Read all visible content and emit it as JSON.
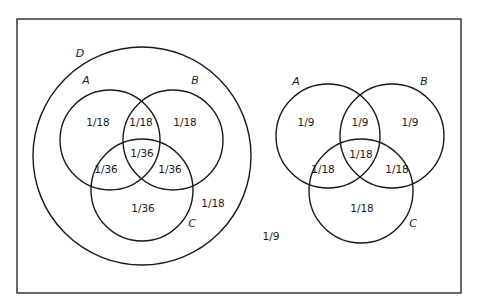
{
  "left_diagram": {
    "set_labels": {
      "D": "D",
      "A": "A",
      "B": "B",
      "C": "C"
    },
    "regions": {
      "A_only": "1/18",
      "A_and_B": "1/18",
      "B_only": "1/18",
      "A_and_B_and_C": "1/36",
      "A_and_C": "1/36",
      "B_and_C": "1/36",
      "C_only": "1/36",
      "D_only": "1/18"
    }
  },
  "outside": "1/9",
  "right_diagram": {
    "set_labels": {
      "A": "A",
      "B": "B",
      "C": "C"
    },
    "regions": {
      "A_only": "1/9",
      "A_and_B": "1/9",
      "B_only": "1/9",
      "A_and_B_and_C": "1/18",
      "A_and_C": "1/18",
      "B_and_C": "1/18",
      "C_only": "1/18"
    }
  }
}
